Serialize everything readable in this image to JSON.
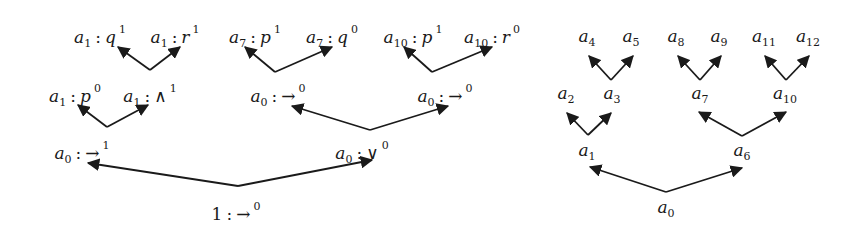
{
  "diagram": {
    "left_tree": {
      "nodes": [
        {
          "id": "L1",
          "var": "a",
          "sub": "1",
          "sym": "q",
          "op": false,
          "sup": "1",
          "x": 100,
          "y": 36
        },
        {
          "id": "L2",
          "var": "a",
          "sub": "1",
          "sym": "r",
          "op": false,
          "sup": "1",
          "x": 175,
          "y": 36
        },
        {
          "id": "L3",
          "var": "a",
          "sub": "7",
          "sym": "p",
          "op": false,
          "sup": "1",
          "x": 255,
          "y": 36
        },
        {
          "id": "L4",
          "var": "a",
          "sub": "7",
          "sym": "q",
          "op": false,
          "sup": "0",
          "x": 332,
          "y": 36
        },
        {
          "id": "L5",
          "var": "a",
          "sub": "10",
          "sym": "p",
          "op": false,
          "sup": "1",
          "x": 413,
          "y": 36
        },
        {
          "id": "L6",
          "var": "a",
          "sub": "10",
          "sym": "r",
          "op": false,
          "sup": "0",
          "x": 492,
          "y": 36
        },
        {
          "id": "L7",
          "var": "a",
          "sub": "1",
          "sym": "p",
          "op": false,
          "sup": "0",
          "x": 75,
          "y": 95
        },
        {
          "id": "L8",
          "var": "a",
          "sub": "1",
          "sym": "∧",
          "op": true,
          "sup": "1",
          "x": 150,
          "y": 95
        },
        {
          "id": "L9",
          "var": "a",
          "sub": "0",
          "sym": "→",
          "op": true,
          "sup": "0",
          "x": 278,
          "y": 95
        },
        {
          "id": "L10",
          "var": "a",
          "sub": "0",
          "sym": "→",
          "op": true,
          "sup": "0",
          "x": 445,
          "y": 95
        },
        {
          "id": "L11",
          "var": "a",
          "sub": "0",
          "sym": "→",
          "op": true,
          "sup": "1",
          "x": 82,
          "y": 152
        },
        {
          "id": "L12",
          "var": "a",
          "sub": "0",
          "sym": "∨",
          "op": true,
          "sup": "0",
          "x": 362,
          "y": 152
        },
        {
          "id": "L13",
          "var": "",
          "sub": "",
          "num": "1",
          "sym": "→",
          "op": true,
          "sup": "0",
          "x": 236,
          "y": 212
        }
      ],
      "edges": [
        {
          "from": [
            150,
            70
          ],
          "to": [
            118,
            47
          ]
        },
        {
          "from": [
            150,
            70
          ],
          "to": [
            180,
            47
          ]
        },
        {
          "from": [
            275,
            72
          ],
          "to": [
            245,
            47
          ]
        },
        {
          "from": [
            275,
            72
          ],
          "to": [
            332,
            47
          ]
        },
        {
          "from": [
            432,
            72
          ],
          "to": [
            404,
            47
          ]
        },
        {
          "from": [
            432,
            72
          ],
          "to": [
            492,
            47
          ]
        },
        {
          "from": [
            107,
            127
          ],
          "to": [
            78,
            105
          ]
        },
        {
          "from": [
            107,
            127
          ],
          "to": [
            148,
            105
          ]
        },
        {
          "from": [
            370,
            130
          ],
          "to": [
            292,
            106
          ]
        },
        {
          "from": [
            370,
            130
          ],
          "to": [
            448,
            106
          ]
        },
        {
          "from": [
            238,
            186
          ],
          "to": [
            88,
            163
          ]
        },
        {
          "from": [
            238,
            186
          ],
          "to": [
            372,
            160
          ]
        }
      ]
    },
    "right_tree": {
      "nodes": [
        {
          "id": "R4",
          "var": "a",
          "sub": "4",
          "x": 587,
          "y": 38
        },
        {
          "id": "R5",
          "var": "a",
          "sub": "5",
          "x": 631,
          "y": 38
        },
        {
          "id": "R8",
          "var": "a",
          "sub": "8",
          "x": 676,
          "y": 38
        },
        {
          "id": "R9",
          "var": "a",
          "sub": "9",
          "x": 719,
          "y": 38
        },
        {
          "id": "R11",
          "var": "a",
          "sub": "11",
          "x": 764,
          "y": 38
        },
        {
          "id": "R12",
          "var": "a",
          "sub": "12",
          "x": 808,
          "y": 38
        },
        {
          "id": "R2",
          "var": "a",
          "sub": "2",
          "x": 566,
          "y": 95
        },
        {
          "id": "R3",
          "var": "a",
          "sub": "3",
          "x": 612,
          "y": 95
        },
        {
          "id": "R7",
          "var": "a",
          "sub": "7",
          "x": 700,
          "y": 95
        },
        {
          "id": "R10",
          "var": "a",
          "sub": "10",
          "x": 785,
          "y": 95
        },
        {
          "id": "R1",
          "var": "a",
          "sub": "1",
          "x": 587,
          "y": 152
        },
        {
          "id": "R6",
          "var": "a",
          "sub": "6",
          "x": 742,
          "y": 152
        },
        {
          "id": "R0",
          "var": "a",
          "sub": "0",
          "x": 666,
          "y": 209
        }
      ],
      "edges": [
        {
          "from": [
            611,
            80
          ],
          "to": [
            589,
            56
          ]
        },
        {
          "from": [
            611,
            80
          ],
          "to": [
            633,
            56
          ]
        },
        {
          "from": [
            700,
            80
          ],
          "to": [
            678,
            56
          ]
        },
        {
          "from": [
            700,
            80
          ],
          "to": [
            721,
            56
          ]
        },
        {
          "from": [
            786,
            80
          ],
          "to": [
            765,
            56
          ]
        },
        {
          "from": [
            786,
            80
          ],
          "to": [
            809,
            56
          ]
        },
        {
          "from": [
            588,
            135
          ],
          "to": [
            567,
            113
          ]
        },
        {
          "from": [
            588,
            135
          ],
          "to": [
            611,
            113
          ]
        },
        {
          "from": [
            742,
            136
          ],
          "to": [
            699,
            112
          ]
        },
        {
          "from": [
            742,
            136
          ],
          "to": [
            786,
            112
          ]
        },
        {
          "from": [
            666,
            192
          ],
          "to": [
            590,
            167
          ]
        },
        {
          "from": [
            666,
            192
          ],
          "to": [
            742,
            168
          ]
        }
      ]
    },
    "colors": {
      "ink": "#1a1a1a",
      "background": "#ffffff"
    }
  }
}
